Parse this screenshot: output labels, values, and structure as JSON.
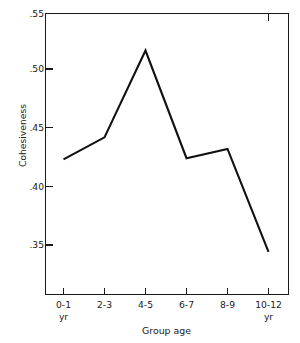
{
  "chart_data": {
    "type": "line",
    "title": "",
    "xlabel": "Group age",
    "ylabel": "Cohesiveness",
    "categories": [
      "0-1\nyr",
      "2-3",
      "4-5",
      "6-7",
      "8-9",
      "10-12\nyr"
    ],
    "x_tick_labels": [
      {
        "primary": "0-1",
        "secondary": "yr"
      },
      {
        "primary": "2-3",
        "secondary": ""
      },
      {
        "primary": "4-5",
        "secondary": ""
      },
      {
        "primary": "6-7",
        "secondary": ""
      },
      {
        "primary": "8-9",
        "secondary": ""
      },
      {
        "primary": "10-12",
        "secondary": "yr"
      }
    ],
    "values": [
      0.424,
      0.443,
      0.518,
      0.425,
      0.433,
      0.344
    ],
    "y_tick_labels": [
      ".55",
      ".50",
      ".45",
      ".40",
      ".35"
    ],
    "y_tick_values": [
      0.55,
      0.5,
      0.45,
      0.4,
      0.35
    ],
    "ylim": [
      0.315,
      0.55
    ],
    "xlim": [
      0,
      7
    ],
    "grid": false,
    "legend": null,
    "line_color": "#111111",
    "axis_color": "#1a1a1a",
    "background_color": "#ffffff",
    "series": [
      {
        "name": "Cohesiveness",
        "values": [
          0.424,
          0.443,
          0.518,
          0.425,
          0.433,
          0.344
        ]
      }
    ]
  }
}
